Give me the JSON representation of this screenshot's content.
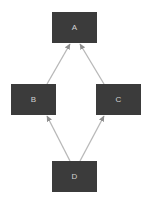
{
  "diagram": {
    "type": "directed-acyclic-graph",
    "title": "",
    "canvas": {
      "width": 152,
      "height": 203,
      "background": "#ffffff"
    },
    "style": {
      "node_fill": "#3b3b3b",
      "node_text": "#d2d2d2",
      "edge_color": "#b8b8b8",
      "arrow_color": "#8f8f8f",
      "edge_width": 1.3
    },
    "nodes": [
      {
        "id": "A",
        "label": "A",
        "x": 52,
        "y": 12,
        "w": 45,
        "h": 31
      },
      {
        "id": "B",
        "label": "B",
        "x": 11,
        "y": 84,
        "w": 45,
        "h": 31
      },
      {
        "id": "C",
        "label": "C",
        "x": 96,
        "y": 84,
        "w": 45,
        "h": 31
      },
      {
        "id": "D",
        "label": "D",
        "x": 52,
        "y": 161,
        "w": 45,
        "h": 31
      }
    ],
    "edges": [
      {
        "id": "B-A",
        "from": "B",
        "to": "A",
        "x1": 47,
        "y1": 84,
        "x2": 70,
        "y2": 44,
        "arrowhead": "at-target"
      },
      {
        "id": "C-A",
        "from": "C",
        "to": "A",
        "x1": 104,
        "y1": 84,
        "x2": 80,
        "y2": 44,
        "arrowhead": "at-target"
      },
      {
        "id": "D-B",
        "from": "D",
        "to": "B",
        "x1": 70,
        "y1": 161,
        "x2": 47,
        "y2": 116,
        "arrowhead": "at-target"
      },
      {
        "id": "D-C",
        "from": "D",
        "to": "C",
        "x1": 80,
        "y1": 161,
        "x2": 104,
        "y2": 116,
        "arrowhead": "at-target"
      }
    ]
  }
}
